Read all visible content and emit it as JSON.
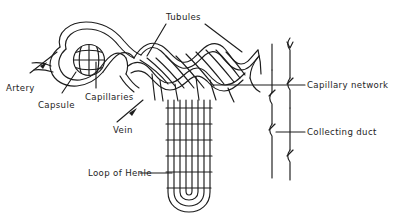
{
  "diagram": {
    "background_color": "#ffffff",
    "ink_color": "#1d1d1d",
    "style": "black-and-white line drawing",
    "width": 419,
    "height": 224
  },
  "labels": {
    "tubules": "Tubules",
    "artery": "Artery",
    "capsule": "Capsule",
    "capillaries": "Capillaries",
    "vein": "Vein",
    "loop_of_henle": "Loop of Henle",
    "capillary_network": "Capillary network",
    "collecting_duct": "Collecting duct"
  },
  "parts": [
    {
      "id": "glomerulus",
      "name": "glomerulus-capillary-tuft",
      "label_key": "capillaries",
      "description": "cross-hatched circle inside Bowman's capsule"
    },
    {
      "id": "bowmans-capsule",
      "name": "bowmans-capsule",
      "label_key": "capsule",
      "description": "curved cup enclosing the glomerulus"
    },
    {
      "id": "afferent-artery",
      "name": "afferent-artery",
      "label_key": "artery",
      "description": "vessel entering the capsule from lower left"
    },
    {
      "id": "efferent-vein",
      "name": "efferent-vein",
      "label_key": "vein",
      "description": "vessel leaving the capsule region"
    },
    {
      "id": "convoluted-tubules",
      "name": "convoluted-tubules",
      "label_key": "tubules",
      "description": "wavy double-line tubules across the top"
    },
    {
      "id": "loop-of-henle",
      "name": "loop-of-henle",
      "label_key": "loop_of_henle",
      "description": "long U-shaped descending and ascending limb with rungs"
    },
    {
      "id": "peritubular-capillary-network",
      "name": "peritubular-capillary-network",
      "label_key": "capillary_network",
      "description": "left vertical line with break marks on the right side"
    },
    {
      "id": "collecting-duct",
      "name": "collecting-duct",
      "label_key": "collecting_duct",
      "description": "right vertical line with break marks on the right side"
    }
  ],
  "leaders": {
    "artery": "arrow",
    "capsule": "plain",
    "capillaries": "plain",
    "vein": "arrow",
    "tubules": "two-plain",
    "loop_of_henle": "plain-horizontal",
    "capillary_network": "plain-horizontal",
    "collecting_duct": "plain-horizontal"
  }
}
